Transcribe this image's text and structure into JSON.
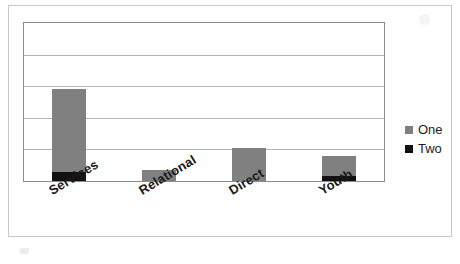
{
  "chart_data": {
    "type": "bar",
    "subtype": "stacked-column",
    "title": "",
    "xlabel": "",
    "ylabel": "",
    "categories": [
      "Services",
      "Relational",
      "Direct",
      "Youth"
    ],
    "series": [
      {
        "name": "One",
        "color": "#808080",
        "values": [
          2.6,
          0.35,
          1.05,
          0.65
        ]
      },
      {
        "name": "Two",
        "color": "#111111",
        "values": [
          0.3,
          0.0,
          0.0,
          0.15
        ]
      }
    ],
    "totals": [
      2.9,
      0.35,
      1.05,
      0.8
    ],
    "ylim": [
      0,
      5
    ],
    "yticks": [
      0,
      1,
      2,
      3,
      4,
      5
    ],
    "gridlines": 5,
    "grid": true,
    "axis_tick_labels_visible": false,
    "legend_position": "right",
    "legend_entries": [
      "One",
      "Two"
    ],
    "category_label_rotation_deg": -31
  },
  "legend": {
    "items": [
      {
        "label": "One",
        "swatch_color": "#808080",
        "swatch_icon": "square-icon"
      },
      {
        "label": "Two",
        "swatch_color": "#111111",
        "swatch_icon": "square-icon"
      }
    ]
  },
  "axis": {
    "categories": [
      "Services",
      "Relational",
      "Direct",
      "Youth"
    ]
  },
  "colors": {
    "series_one": "#808080",
    "series_two": "#111111",
    "gridline": "#b4b4b4",
    "plot_border": "#8c8c8c",
    "card_border": "#c9c9c9",
    "background": "#ffffff",
    "label_text": "#1a1a1a"
  }
}
